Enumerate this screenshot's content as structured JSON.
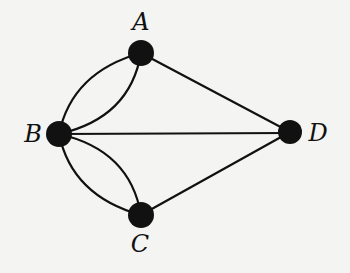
{
  "diagram": {
    "type": "multigraph",
    "nodes": [
      {
        "id": "A",
        "label": "A",
        "x": 141,
        "y": 53,
        "r": 13,
        "label_x": 141,
        "label_y": 30
      },
      {
        "id": "B",
        "label": "B",
        "x": 59,
        "y": 134,
        "r": 13,
        "label_x": 33,
        "label_y": 142
      },
      {
        "id": "C",
        "label": "C",
        "x": 141,
        "y": 215,
        "r": 13,
        "label_x": 140,
        "label_y": 252
      },
      {
        "id": "D",
        "label": "D",
        "x": 290,
        "y": 132,
        "r": 12,
        "label_x": 318,
        "label_y": 141
      }
    ],
    "edges": [
      {
        "from": "B",
        "to": "A",
        "kind": "curve-outer"
      },
      {
        "from": "B",
        "to": "A",
        "kind": "curve-inner"
      },
      {
        "from": "B",
        "to": "C",
        "kind": "curve-outer"
      },
      {
        "from": "B",
        "to": "C",
        "kind": "curve-inner"
      },
      {
        "from": "B",
        "to": "D",
        "kind": "straight"
      },
      {
        "from": "A",
        "to": "D",
        "kind": "straight"
      },
      {
        "from": "C",
        "to": "D",
        "kind": "straight"
      }
    ],
    "colors": {
      "background": "#f4f4f2",
      "stroke": "#111111",
      "node_fill": "#111111"
    }
  }
}
